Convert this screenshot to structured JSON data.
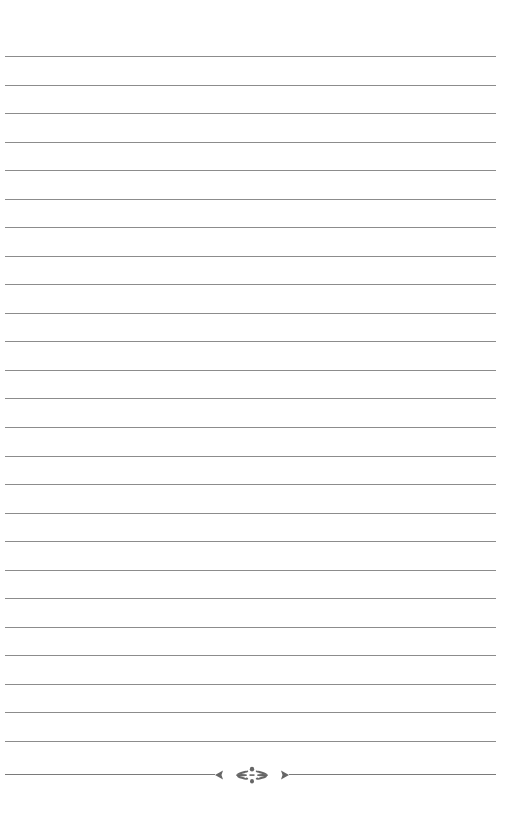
{
  "page": {
    "type": "lined-notebook-page",
    "background_color": "#ffffff",
    "rule_color": "#8c8c8c",
    "ornament_color": "#666666",
    "rule_count": 25,
    "rule_first_y": 56,
    "rule_spacing": 28.54,
    "rule_left": 5,
    "rule_width": 491
  },
  "footer": {
    "ornament_icon": "floral-divider-ornament"
  }
}
